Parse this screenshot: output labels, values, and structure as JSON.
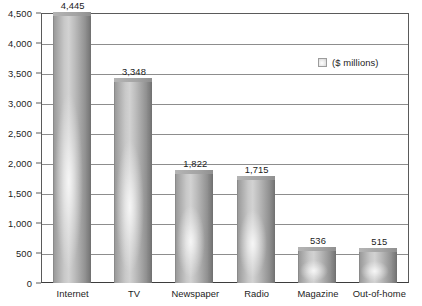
{
  "chart_data": {
    "type": "bar",
    "title": "",
    "subtitle": "",
    "xlabel": "",
    "ylabel": "",
    "categories": [
      "Internet",
      "TV",
      "Newspaper",
      "Radio",
      "Magazine",
      "Out-of-home"
    ],
    "values": [
      4445,
      3348,
      1822,
      1715,
      536,
      515
    ],
    "value_labels": [
      "4,445",
      "3,348",
      "1,822",
      "1,715",
      "536",
      "515"
    ],
    "series": [
      {
        "name": "($ millions)",
        "values": [
          4445,
          3348,
          1822,
          1715,
          536,
          515
        ]
      }
    ],
    "ylim": [
      0,
      4500
    ],
    "ytick_step": 500,
    "ytick_values": [
      0,
      500,
      1000,
      1500,
      2000,
      2500,
      3000,
      3500,
      4000,
      4500
    ],
    "ytick_labels": [
      "0",
      "500",
      "1,000",
      "1,500",
      "2,000",
      "2,500",
      "3,000",
      "3,500",
      "4,000",
      "4,500"
    ],
    "grid": true,
    "grid_axis": "y",
    "legend": {
      "position": "inside-top-right",
      "entries": [
        {
          "label": "($ millions)",
          "swatch": "gray-gradient"
        }
      ]
    },
    "bar_style": "3d-gradient-gray",
    "colors": {
      "bar_face_light": "#d2d2d2",
      "bar_face_dark": "#8e8e8e",
      "bar_side": "#7e7e7e",
      "bar_top": "#a4a4a4",
      "gridline": "#8d8d8d",
      "axis": "#5a5a5a",
      "text": "#1c1c1c",
      "background": "#ffffff"
    }
  }
}
